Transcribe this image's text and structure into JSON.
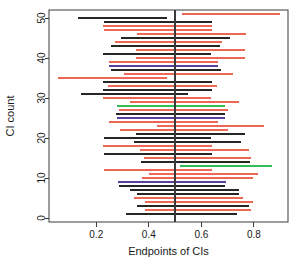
{
  "chart_data": {
    "type": "line",
    "title": "",
    "subtitle": "",
    "xlabel": "Endpoints of CIs",
    "ylabel": "CI count",
    "xlim": [
      0.02,
      0.93
    ],
    "ylim": [
      -1,
      52
    ],
    "xticks": [
      0.2,
      0.4,
      0.6,
      0.8
    ],
    "xticklabels": [
      "0.2",
      "0.4",
      "0.6",
      "0.8"
    ],
    "yticks": [
      0,
      10,
      20,
      30,
      40,
      50
    ],
    "yticklabels": [
      "0",
      "10",
      "20",
      "30",
      "40",
      "50"
    ],
    "grid": false,
    "legend": "none",
    "reference_line": {
      "orientation": "vertical",
      "x": 0.5,
      "color": "#3a3a3a"
    },
    "colors": {
      "covering": "#262626",
      "non_covering": "#ee6655",
      "highlight_green": "#33bb55",
      "highlight_purple": "#5b3f9e",
      "axis": "#3a3a3a",
      "background": "#ffffff"
    },
    "series": [
      {
        "name": "CI 1",
        "y": 1,
        "lo": 0.315,
        "hi": 0.735,
        "color": "#262626"
      },
      {
        "name": "CI 2",
        "y": 2,
        "lo": 0.385,
        "hi": 0.79,
        "color": "#ee6655"
      },
      {
        "name": "CI 3",
        "y": 3,
        "lo": 0.355,
        "hi": 0.78,
        "color": "#262626"
      },
      {
        "name": "CI 4",
        "y": 4,
        "lo": 0.385,
        "hi": 0.795,
        "color": "#ee6655"
      },
      {
        "name": "CI 5",
        "y": 5,
        "lo": 0.345,
        "hi": 0.76,
        "color": "#ee6655"
      },
      {
        "name": "CI 6",
        "y": 6,
        "lo": 0.355,
        "hi": 0.745,
        "color": "#262626"
      },
      {
        "name": "CI 7",
        "y": 7,
        "lo": 0.33,
        "hi": 0.745,
        "color": "#262626"
      },
      {
        "name": "CI 8",
        "y": 8,
        "lo": 0.285,
        "hi": 0.69,
        "color": "#262626"
      },
      {
        "name": "CI 9",
        "y": 9,
        "lo": 0.283,
        "hi": 0.695,
        "color": "#5b3f9e"
      },
      {
        "name": "CI 10",
        "y": 10,
        "lo": 0.375,
        "hi": 0.795,
        "color": "#ee6655"
      },
      {
        "name": "CI 11",
        "y": 11,
        "lo": 0.4,
        "hi": 0.815,
        "color": "#ee6655"
      },
      {
        "name": "CI 12",
        "y": 12,
        "lo": 0.23,
        "hi": 0.64,
        "color": "#ee6655"
      },
      {
        "name": "CI 13",
        "y": 13,
        "lo": 0.52,
        "hi": 0.87,
        "color": "#33bb55"
      },
      {
        "name": "CI 14",
        "y": 14,
        "lo": 0.37,
        "hi": 0.785,
        "color": "#262626"
      },
      {
        "name": "CI 15",
        "y": 15,
        "lo": 0.38,
        "hi": 0.79,
        "color": "#ee6655"
      },
      {
        "name": "CI 16",
        "y": 16,
        "lo": 0.23,
        "hi": 0.64,
        "color": "#262626"
      },
      {
        "name": "CI 17",
        "y": 17,
        "lo": 0.365,
        "hi": 0.78,
        "color": "#ee6655"
      },
      {
        "name": "CI 18",
        "y": 18,
        "lo": 0.225,
        "hi": 0.64,
        "color": "#ee6655"
      },
      {
        "name": "CI 19",
        "y": 19,
        "lo": 0.345,
        "hi": 0.75,
        "color": "#262626"
      },
      {
        "name": "CI 20",
        "y": 20,
        "lo": 0.23,
        "hi": 0.635,
        "color": "#262626"
      },
      {
        "name": "CI 21",
        "y": 21,
        "lo": 0.35,
        "hi": 0.765,
        "color": "#262626"
      },
      {
        "name": "CI 22",
        "y": 22,
        "lo": 0.29,
        "hi": 0.7,
        "color": "#ee6655"
      },
      {
        "name": "CI 23",
        "y": 23,
        "lo": 0.43,
        "hi": 0.84,
        "color": "#ee6655"
      },
      {
        "name": "CI 24",
        "y": 24,
        "lo": 0.25,
        "hi": 0.665,
        "color": "#ee6655"
      },
      {
        "name": "CI 25",
        "y": 25,
        "lo": 0.28,
        "hi": 0.69,
        "color": "#5b3f9e"
      },
      {
        "name": "CI 26",
        "y": 26,
        "lo": 0.275,
        "hi": 0.69,
        "color": "#262626"
      },
      {
        "name": "CI 27",
        "y": 27,
        "lo": 0.285,
        "hi": 0.7,
        "color": "#ee6655"
      },
      {
        "name": "CI 28",
        "y": 28,
        "lo": 0.28,
        "hi": 0.69,
        "color": "#33bb55"
      },
      {
        "name": "CI 29",
        "y": 29,
        "lo": 0.33,
        "hi": 0.745,
        "color": "#ee6655"
      },
      {
        "name": "CI 30",
        "y": 30,
        "lo": 0.225,
        "hi": 0.635,
        "color": "#ee6655"
      },
      {
        "name": "CI 31",
        "y": 31,
        "lo": 0.14,
        "hi": 0.55,
        "color": "#262626"
      },
      {
        "name": "CI 32",
        "y": 32,
        "lo": 0.225,
        "hi": 0.64,
        "color": "#262626"
      },
      {
        "name": "CI 33",
        "y": 33,
        "lo": 0.245,
        "hi": 0.66,
        "color": "#ee6655"
      },
      {
        "name": "CI 34",
        "y": 34,
        "lo": 0.225,
        "hi": 0.64,
        "color": "#262626"
      },
      {
        "name": "CI 35",
        "y": 35,
        "lo": 0.055,
        "hi": 0.47,
        "color": "#ee6655"
      },
      {
        "name": "CI 36",
        "y": 36,
        "lo": 0.305,
        "hi": 0.72,
        "color": "#ee6655"
      },
      {
        "name": "CI 37",
        "y": 37,
        "lo": 0.255,
        "hi": 0.675,
        "color": "#262626"
      },
      {
        "name": "CI 38",
        "y": 38,
        "lo": 0.25,
        "hi": 0.665,
        "color": "#5b3f9e"
      },
      {
        "name": "CI 39",
        "y": 39,
        "lo": 0.25,
        "hi": 0.665,
        "color": "#ee6655"
      },
      {
        "name": "CI 40",
        "y": 40,
        "lo": 0.35,
        "hi": 0.765,
        "color": "#ee6655"
      },
      {
        "name": "CI 41",
        "y": 41,
        "lo": 0.225,
        "hi": 0.635,
        "color": "#262626"
      },
      {
        "name": "CI 42",
        "y": 42,
        "lo": 0.35,
        "hi": 0.765,
        "color": "#ee6655"
      },
      {
        "name": "CI 43",
        "y": 43,
        "lo": 0.255,
        "hi": 0.67,
        "color": "#262626"
      },
      {
        "name": "CI 44",
        "y": 44,
        "lo": 0.27,
        "hi": 0.68,
        "color": "#ee6655"
      },
      {
        "name": "CI 45",
        "y": 45,
        "lo": 0.295,
        "hi": 0.71,
        "color": "#262626"
      },
      {
        "name": "CI 46",
        "y": 46,
        "lo": 0.355,
        "hi": 0.77,
        "color": "#ee6655"
      },
      {
        "name": "CI 47",
        "y": 47,
        "lo": 0.23,
        "hi": 0.64,
        "color": "#ee6655"
      },
      {
        "name": "CI 48",
        "y": 48,
        "lo": 0.225,
        "hi": 0.64,
        "color": "#ee6655"
      },
      {
        "name": "CI 49",
        "y": 49,
        "lo": 0.23,
        "hi": 0.64,
        "color": "#262626"
      },
      {
        "name": "CI 50",
        "y": 50,
        "lo": 0.13,
        "hi": 0.47,
        "color": "#262626"
      },
      {
        "name": "CI 51",
        "y": 51,
        "lo": 0.525,
        "hi": 0.9,
        "color": "#ee6655"
      }
    ]
  }
}
